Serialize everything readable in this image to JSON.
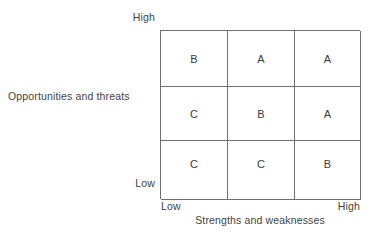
{
  "chart_data": {
    "type": "heatmap",
    "title": "",
    "xlabel": "Strengths and weaknesses",
    "ylabel": "Opportunities and threats",
    "x_tick_labels": [
      "Low",
      "High"
    ],
    "y_tick_labels": [
      "Low",
      "High"
    ],
    "grid": true,
    "legend": "none",
    "columns": [
      "Low",
      "Medium",
      "High"
    ],
    "rows": [
      "High",
      "Medium",
      "Low"
    ],
    "cells": [
      [
        "B",
        "A",
        "A"
      ],
      [
        "C",
        "B",
        "A"
      ],
      [
        "C",
        "C",
        "B"
      ]
    ],
    "cell_list": [
      {
        "row": 0,
        "col": 0,
        "value": "B"
      },
      {
        "row": 0,
        "col": 1,
        "value": "A"
      },
      {
        "row": 0,
        "col": 2,
        "value": "A"
      },
      {
        "row": 1,
        "col": 0,
        "value": "C"
      },
      {
        "row": 1,
        "col": 1,
        "value": "B"
      },
      {
        "row": 1,
        "col": 2,
        "value": "A"
      },
      {
        "row": 2,
        "col": 0,
        "value": "C"
      },
      {
        "row": 2,
        "col": 1,
        "value": "C"
      },
      {
        "row": 2,
        "col": 2,
        "value": "B"
      }
    ]
  },
  "axes": {
    "y": {
      "title": "Opportunities and threats",
      "high_label": "High",
      "low_label": "Low"
    },
    "x": {
      "title": "Strengths and weaknesses",
      "low_label": "Low",
      "high_label": "High"
    }
  },
  "colors": {
    "background": "#ffffff",
    "line": "#6e6e6e",
    "text": "#3a3a3a"
  }
}
